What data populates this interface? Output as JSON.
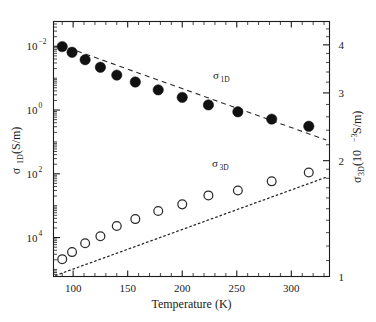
{
  "chart_data": {
    "type": "scatter",
    "title": "",
    "xlabel": "Temperature (K)",
    "ylabel": "σ_1D (S/m)",
    "ylabel_right": "σ_3D (10^-3 S/m)",
    "xlim": [
      82,
      335
    ],
    "xscale": "linear",
    "yscale": "log",
    "ylim": [
      0.0006,
      60000
    ],
    "ylim_right": [
      1.0,
      4.6
    ],
    "grid": false,
    "legend": "inline-annotations",
    "xticks": [
      100,
      150,
      200,
      250,
      300
    ],
    "xtick_labels": [
      "100",
      "150",
      "200",
      "250",
      "300"
    ],
    "yticks_left": [
      0.01,
      1,
      100,
      10000
    ],
    "ytick_labels_left": [
      "10⁻²",
      "10⁰",
      "10²",
      "10⁴"
    ],
    "yticks_right": [
      1,
      2,
      3,
      4
    ],
    "ytick_labels_right": [
      "1",
      "2",
      "3",
      "4"
    ],
    "series": [
      {
        "name": "σ_1D",
        "marker": "filled-circle",
        "axis": "left",
        "annotation": "σ_1D",
        "annotation_base": "σ",
        "annotation_sub": "1D",
        "x": [
          90,
          99,
          111,
          125,
          140,
          157,
          178,
          200,
          224,
          251,
          282,
          316
        ],
        "y": [
          9800,
          6500,
          3800,
          2200,
          1250,
          760,
          430,
          250,
          145,
          88,
          52,
          31
        ]
      },
      {
        "name": "σ_3D",
        "marker": "open-circle",
        "axis": "left",
        "annotation": "σ_3D",
        "annotation_base": "σ",
        "annotation_sub": "3D",
        "x": [
          90,
          99,
          111,
          125,
          140,
          157,
          178,
          200,
          224,
          251,
          282,
          316
        ],
        "y": [
          0.0021,
          0.0035,
          0.0066,
          0.011,
          0.023,
          0.038,
          0.068,
          0.11,
          0.21,
          0.3,
          0.58,
          1.1
        ]
      }
    ],
    "fits": [
      {
        "name": "σ_1D-fit",
        "style": "dashed",
        "x": [
          88,
          332
        ],
        "y": [
          11000,
          11.5
        ]
      },
      {
        "name": "σ_3D-fit",
        "style": "dotted",
        "x": [
          84,
          332
        ],
        "y": [
          0.00065,
          0.78
        ]
      }
    ]
  },
  "axes": {
    "x_title": "Temperature (K)",
    "y_left_title_base": "σ",
    "y_left_title_sub": "1D",
    "y_left_title_rest": " (S/m)",
    "y_right_title_base": "σ",
    "y_right_title_sub": "3D",
    "y_right_title_rest_open": " (10",
    "y_right_title_exp": "−3",
    "y_right_title_rest_close": " S/m)"
  },
  "ticks": {
    "x_labels": [
      "100",
      "150",
      "200",
      "250",
      "300"
    ],
    "y_left_mantissa": "10",
    "y_left_exponents": [
      "4",
      "2",
      "0",
      "−2"
    ],
    "y_right_labels": [
      "4",
      "3",
      "2",
      "1"
    ]
  },
  "annotations": {
    "sigma_1d_base": "σ",
    "sigma_1d_sub": "1D",
    "sigma_3d_base": "σ",
    "sigma_3d_sub": "3D"
  }
}
